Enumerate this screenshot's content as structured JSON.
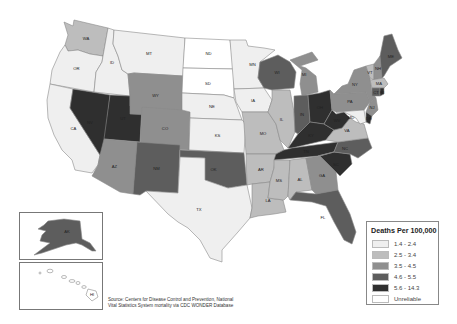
{
  "legend": {
    "title": "Deaths Per 100,000",
    "items": [
      {
        "label": "1.4 - 2.4",
        "color": "#efefef"
      },
      {
        "label": "2.5 - 3.4",
        "color": "#bdbdbd"
      },
      {
        "label": "3.5 - 4.5",
        "color": "#8f8f8f"
      },
      {
        "label": "4.6 - 5.5",
        "color": "#5d5d5d"
      },
      {
        "label": "5.6 - 14.3",
        "color": "#2f2f2f"
      },
      {
        "label": "Unreliable",
        "color": "#ffffff"
      }
    ]
  },
  "source": {
    "line1": "Source: Centers for Disease Control and Prevention, National",
    "line2": "Vital Statistics System mortality via CDC WONDER Database"
  },
  "states": {
    "WA": {
      "label": "WA",
      "bin": 1
    },
    "OR": {
      "label": "OR",
      "bin": 0
    },
    "CA": {
      "label": "CA",
      "bin": 0
    },
    "ID": {
      "label": "ID",
      "bin": 0
    },
    "NV": {
      "label": "NV",
      "bin": 4
    },
    "UT": {
      "label": "UT",
      "bin": 4
    },
    "AZ": {
      "label": "AZ",
      "bin": 2
    },
    "MT": {
      "label": "MT",
      "bin": 0
    },
    "WY": {
      "label": "WY",
      "bin": 2
    },
    "CO": {
      "label": "CO",
      "bin": 2
    },
    "NM": {
      "label": "NM",
      "bin": 3
    },
    "ND": {
      "label": "ND",
      "bin": 5
    },
    "SD": {
      "label": "SD",
      "bin": 5
    },
    "NE": {
      "label": "NE",
      "bin": 0
    },
    "KS": {
      "label": "KS",
      "bin": 0
    },
    "OK": {
      "label": "OK",
      "bin": 3
    },
    "TX": {
      "label": "TX",
      "bin": 0
    },
    "MN": {
      "label": "MN",
      "bin": 0
    },
    "IA": {
      "label": "IA",
      "bin": 0
    },
    "MO": {
      "label": "MO",
      "bin": 1
    },
    "AR": {
      "label": "AR",
      "bin": 1
    },
    "LA": {
      "label": "LA",
      "bin": 1
    },
    "WI": {
      "label": "WI",
      "bin": 3
    },
    "IL": {
      "label": "IL",
      "bin": 1
    },
    "MI": {
      "label": "MI",
      "bin": 2
    },
    "IN": {
      "label": "IN",
      "bin": 3
    },
    "OH": {
      "label": "OH",
      "bin": 4
    },
    "KY": {
      "label": "KY",
      "bin": 4
    },
    "TN": {
      "label": "TN",
      "bin": 4
    },
    "MS": {
      "label": "MS",
      "bin": 1
    },
    "AL": {
      "label": "AL",
      "bin": 1
    },
    "GA": {
      "label": "GA",
      "bin": 2
    },
    "FL": {
      "label": "FL",
      "bin": 3
    },
    "SC": {
      "label": "SC",
      "bin": 4
    },
    "NC": {
      "label": "NC",
      "bin": 3
    },
    "VA": {
      "label": "VA",
      "bin": 1
    },
    "WV": {
      "label": "WV",
      "bin": 4
    },
    "PA": {
      "label": "PA",
      "bin": 2
    },
    "NY": {
      "label": "NY",
      "bin": 2
    },
    "VT": {
      "label": "VT",
      "bin": 1
    },
    "NH": {
      "label": "NH",
      "bin": 2
    },
    "ME": {
      "label": "ME",
      "bin": 3
    },
    "MA": {
      "label": "MA",
      "bin": 1
    },
    "CT": {
      "label": "CT",
      "bin": 3
    },
    "RI": {
      "label": "RI",
      "bin": 4
    },
    "NJ": {
      "label": "NJ",
      "bin": 2
    },
    "DE": {
      "label": "DE",
      "bin": 4
    },
    "MD": {
      "label": "MD",
      "bin": 0
    },
    "AK": {
      "label": "AK",
      "bin": 3
    },
    "HI": {
      "label": "HI",
      "bin": 5
    }
  }
}
